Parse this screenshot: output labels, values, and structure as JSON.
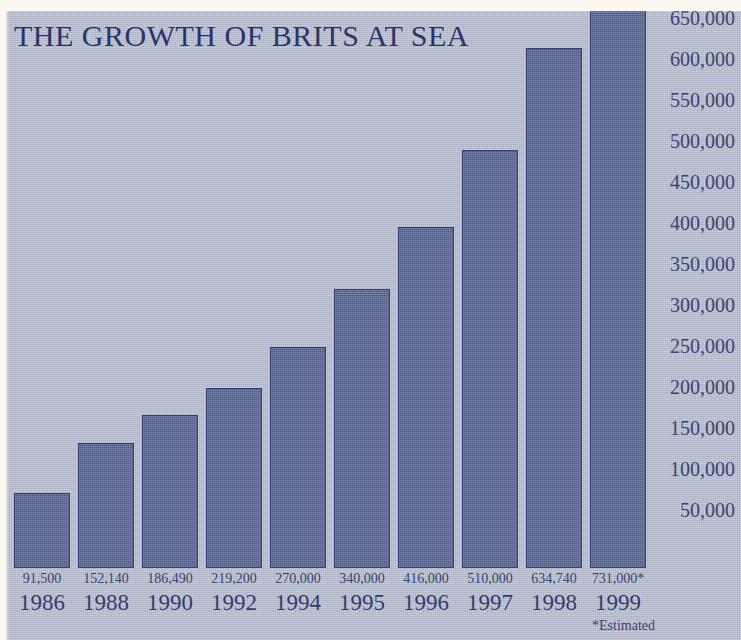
{
  "chart_data": {
    "type": "bar",
    "title": "THE GROWTH OF BRITS AT SEA",
    "xlabel": "",
    "ylabel": "",
    "categories": [
      "1986",
      "1988",
      "1990",
      "1992",
      "1994",
      "1995",
      "1996",
      "1997",
      "1998",
      "1999"
    ],
    "values": [
      91500,
      152140,
      186490,
      219200,
      270000,
      340000,
      416000,
      510000,
      634740,
      731000
    ],
    "value_labels": [
      "91,500",
      "152,140",
      "186,490",
      "219,200",
      "270,000",
      "340,000",
      "416,000",
      "510,000",
      "634,740",
      "731,000*"
    ],
    "ylim": [
      0,
      745000
    ],
    "yticks": [
      700000,
      650000,
      600000,
      550000,
      500000,
      450000,
      400000,
      350000,
      300000,
      250000,
      200000,
      150000,
      100000,
      50000
    ],
    "ytick_labels": [
      "700,000",
      "650,000",
      "600,000",
      "550,000",
      "500,000",
      "450,000",
      "400,000",
      "350,000",
      "300,000",
      "250,000",
      "200,000",
      "150,000",
      "100,000",
      "50,000"
    ],
    "grid": false,
    "legend": null,
    "annotations": [
      "*Estimated"
    ],
    "colors": {
      "background": "#b6bdcd",
      "bar_fill": "#5b6a98",
      "bar_outline": "#313c72",
      "text": "#333d6d",
      "title": "#2b3468",
      "paper": "#fdfcf4"
    }
  },
  "footnote": "*Estimated"
}
